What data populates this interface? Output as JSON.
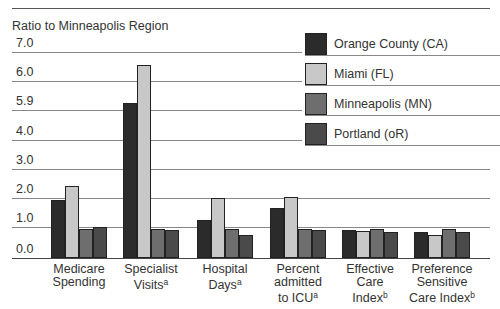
{
  "chart_data": {
    "type": "bar",
    "title": "",
    "ylabel": "Ratio to Minneapolis Region",
    "xlabel": "",
    "ylim": [
      0,
      7
    ],
    "y_ticks": [
      "0.0",
      "1.0",
      "2.0",
      "3.0",
      "4.0",
      "5.9",
      "6.0",
      "7.0"
    ],
    "grid": true,
    "legend_position": "upper right",
    "categories": [
      "Medicare Spending",
      "Specialist Visits(a)",
      "Hospital Days(a)",
      "Percent admitted to ICU(a)",
      "Effective Care Index(b)",
      "Preference Sensitive Care Index(b)"
    ],
    "series": [
      {
        "name": "Orange County (CA)",
        "color": "#2b2b2b",
        "values": [
          2.0,
          5.3,
          1.3,
          1.7,
          0.95,
          0.9
        ]
      },
      {
        "name": "Miami (FL)",
        "color": "#c8c8c8",
        "values": [
          2.45,
          6.6,
          2.05,
          2.1,
          0.93,
          0.8
        ]
      },
      {
        "name": "Minneapolis (MN)",
        "color": "#6e6e6e",
        "values": [
          1.0,
          1.0,
          1.0,
          1.0,
          0.98,
          0.98
        ]
      },
      {
        "name": "Portland (oR)",
        "color": "#4a4a4a",
        "values": [
          1.05,
          0.95,
          0.8,
          0.95,
          0.9,
          0.9
        ]
      }
    ]
  },
  "axis": {
    "y_title": "Ratio to Minneapolis Region",
    "ticks": [
      {
        "label": "7.0",
        "top": 52
      },
      {
        "label": "6.0",
        "top": 81
      },
      {
        "label": "5.9",
        "top": 110
      },
      {
        "label": "4.0",
        "top": 140
      },
      {
        "label": "3.0",
        "top": 169
      },
      {
        "label": "2.0",
        "top": 198
      },
      {
        "label": "1.0",
        "top": 227
      },
      {
        "label": "0.0",
        "top": 258
      }
    ]
  },
  "categories_display": [
    {
      "lines": [
        "Medicare",
        "Spending"
      ],
      "sup": ""
    },
    {
      "lines": [
        "Specialist",
        "Visits"
      ],
      "sup": "a"
    },
    {
      "lines": [
        "Hospital",
        "Days"
      ],
      "sup": "a"
    },
    {
      "lines": [
        "Percent",
        "admitted",
        "to ICU"
      ],
      "sup": "a"
    },
    {
      "lines": [
        "Effective",
        "Care",
        "Index"
      ],
      "sup": "b"
    },
    {
      "lines": [
        "Preference",
        "Sensitive",
        "Care Index"
      ],
      "sup": "b"
    }
  ],
  "legend": [
    {
      "label": "Orange County (CA)",
      "color": "#2b2b2b"
    },
    {
      "label": "Miami (FL)",
      "color": "#c8c8c8"
    },
    {
      "label": "Minneapolis (MN)",
      "color": "#6e6e6e"
    },
    {
      "label": "Portland (oR)",
      "color": "#4a4a4a"
    }
  ]
}
